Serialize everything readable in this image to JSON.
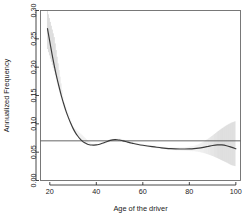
{
  "chart_data": {
    "type": "line",
    "title": "",
    "subtitle": "",
    "xlabel": "Age of the driver",
    "ylabel": "Annualized Frequency",
    "xlim": [
      16,
      102
    ],
    "ylim": [
      0.0,
      0.3
    ],
    "xticks": [
      20,
      40,
      60,
      80,
      100
    ],
    "xtick_labels": [
      "20",
      "40",
      "60",
      "80",
      "100"
    ],
    "yticks": [
      0.0,
      0.05,
      0.1,
      0.15,
      0.2,
      0.25,
      0.3
    ],
    "ytick_labels": [
      "0.00",
      "0.05",
      "0.10",
      "0.15",
      "0.20",
      "0.25",
      "0.30"
    ],
    "grid": false,
    "legend": null,
    "legend_position": "none",
    "box": true,
    "annotations": [],
    "reference_line": {
      "name": "overall-mean-line",
      "orientation": "horizontal",
      "y": 0.07,
      "color": "#555555"
    },
    "series": [
      {
        "name": "Smoothed annualized frequency",
        "style": "line",
        "color": "#3a3a3a",
        "x": [
          19,
          20,
          21,
          22,
          23,
          24,
          25,
          26,
          27,
          28,
          29,
          30,
          31,
          32,
          33,
          34,
          35,
          36,
          37,
          38,
          39,
          40,
          41,
          42,
          43,
          44,
          45,
          46,
          47,
          48,
          49,
          50,
          51,
          52,
          53,
          54,
          55,
          56,
          58,
          60,
          62,
          64,
          66,
          68,
          70,
          72,
          74,
          76,
          78,
          80,
          82,
          84,
          86,
          88,
          90,
          92,
          94,
          96,
          98,
          100
        ],
        "y": [
          0.268,
          0.245,
          0.222,
          0.201,
          0.182,
          0.165,
          0.149,
          0.135,
          0.122,
          0.111,
          0.101,
          0.092,
          0.0845,
          0.0785,
          0.0735,
          0.0695,
          0.0665,
          0.0645,
          0.0632,
          0.0626,
          0.0625,
          0.0628,
          0.0636,
          0.0648,
          0.0662,
          0.0678,
          0.0694,
          0.0708,
          0.0718,
          0.0722,
          0.072,
          0.0714,
          0.0705,
          0.0694,
          0.0683,
          0.0672,
          0.0662,
          0.0652,
          0.0636,
          0.0622,
          0.0609,
          0.0597,
          0.0586,
          0.0576,
          0.0568,
          0.0562,
          0.0558,
          0.0556,
          0.0556,
          0.0558,
          0.0563,
          0.0572,
          0.0585,
          0.0601,
          0.0617,
          0.0628,
          0.0628,
          0.0614,
          0.0589,
          0.056
        ]
      }
    ],
    "confidence_band": {
      "name": "pointwise-confidence-band",
      "style": "vertical-hatch",
      "color": "#9b9b9b",
      "x": [
        19,
        22,
        26,
        30,
        34,
        38,
        42,
        46,
        50,
        54,
        58,
        62,
        66,
        70,
        74,
        78,
        82,
        84,
        86,
        88,
        90,
        92,
        94,
        96,
        98,
        100
      ],
      "lower": [
        0.232,
        0.192,
        0.13,
        0.089,
        0.067,
        0.0606,
        0.0628,
        0.0686,
        0.0694,
        0.0652,
        0.0616,
        0.0588,
        0.0566,
        0.0546,
        0.0532,
        0.0524,
        0.0516,
        0.0505,
        0.0487,
        0.0462,
        0.0432,
        0.0396,
        0.0356,
        0.0318,
        0.0272,
        0.025
      ],
      "upper": [
        0.3,
        0.252,
        0.14,
        0.095,
        0.08,
        0.0646,
        0.0644,
        0.073,
        0.0746,
        0.0692,
        0.0656,
        0.0628,
        0.0606,
        0.059,
        0.0584,
        0.0588,
        0.061,
        0.064,
        0.0682,
        0.0736,
        0.0796,
        0.086,
        0.092,
        0.0975,
        0.102,
        0.105
      ]
    }
  }
}
